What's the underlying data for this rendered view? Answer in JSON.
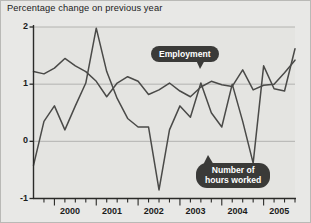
{
  "chart_data": {
    "type": "line",
    "title": "Percentage change on previous year",
    "xlabel": "",
    "ylabel": "",
    "ylim": [
      -1,
      2
    ],
    "xlim": [
      1999.5,
      2005.75
    ],
    "yticks": [
      -1,
      0,
      1,
      2
    ],
    "ytick_labels": [
      "-1",
      "0",
      "1",
      "2"
    ],
    "xticks": [
      2000,
      2001,
      2002,
      2003,
      2004,
      2005
    ],
    "xtick_labels": [
      "2000",
      "2001",
      "2002",
      "2003",
      "2004",
      "2005"
    ],
    "grid": true,
    "grid_axis": "y",
    "legend_position": "inline-callouts",
    "x": [
      1999.5,
      1999.75,
      2000.0,
      2000.25,
      2000.5,
      2000.75,
      2001.0,
      2001.25,
      2001.5,
      2001.75,
      2002.0,
      2002.25,
      2002.5,
      2002.75,
      2003.0,
      2003.25,
      2003.5,
      2003.75,
      2004.0,
      2004.25,
      2004.5,
      2004.75,
      2005.0,
      2005.25,
      2005.5,
      2005.75
    ],
    "series": [
      {
        "name": "Employment",
        "color": "#4a4a48",
        "values": [
          1.22,
          1.18,
          1.28,
          1.45,
          1.32,
          1.22,
          1.05,
          0.78,
          1.02,
          1.13,
          1.05,
          0.82,
          0.9,
          1.02,
          0.88,
          0.78,
          0.95,
          1.05,
          0.99,
          0.96,
          1.25,
          0.9,
          0.98,
          1.0,
          1.2,
          1.42
        ]
      },
      {
        "name": "Number of hours worked",
        "color": "#4a4a48",
        "values": [
          -0.42,
          0.35,
          0.62,
          0.2,
          0.62,
          1.02,
          1.98,
          1.22,
          0.75,
          0.4,
          0.25,
          0.25,
          -0.85,
          0.2,
          0.62,
          0.42,
          1.02,
          0.5,
          0.25,
          1.0,
          0.35,
          -0.38,
          1.32,
          0.92,
          0.88,
          1.62
        ]
      }
    ],
    "annotations": [
      {
        "name": "employment-callout",
        "text": "Employment",
        "target_x": 2003.0,
        "target_y": 1.0
      },
      {
        "name": "hours-callout",
        "text_line1": "Number of",
        "text_line2": "hours worked",
        "target_x": 2003.9,
        "target_y": 0.25
      }
    ]
  },
  "chart": {
    "title": "Percentage change on previous year",
    "y_ticks": [
      {
        "label": "2",
        "value": 2
      },
      {
        "label": "1",
        "value": 1
      },
      {
        "label": "0",
        "value": 0
      },
      {
        "label": "-1",
        "value": -1
      }
    ],
    "x_ticks": [
      {
        "label": "2000"
      },
      {
        "label": "2001"
      },
      {
        "label": "2002"
      },
      {
        "label": "2003"
      },
      {
        "label": "2004"
      },
      {
        "label": "2005"
      }
    ],
    "callouts": {
      "employment": "Employment",
      "hours_line1": "Number of",
      "hours_line2": "hours worked"
    },
    "colors": {
      "background": "#e8e8e6",
      "plot_background": "#e4e4e1",
      "line": "#4a4a48",
      "grid": "#aeaeaa",
      "axis": "#2a2a28",
      "callout_bg": "#3a3a38",
      "callout_text": "#ffffff",
      "text": "#1b1b1b"
    }
  }
}
